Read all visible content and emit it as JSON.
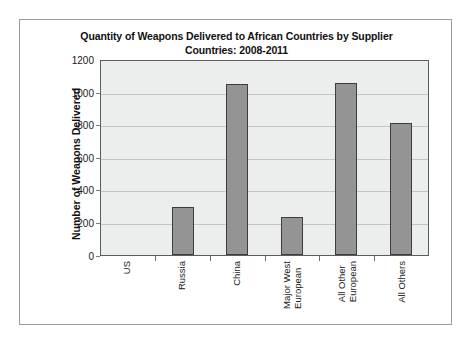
{
  "chart_data": {
    "type": "bar",
    "title": "Quantity of Weapons Delivered to African Countries by Supplier Countries: 2008-2011",
    "title_lines": [
      "Quantity of Weapons Delivered to African Countries by Supplier",
      "Countries: 2008-2011"
    ],
    "xlabel": "",
    "ylabel": "Number of Weapons Delivered",
    "ylim": [
      0,
      1200
    ],
    "ytick_step": 200,
    "yticks": [
      1200,
      1000,
      800,
      600,
      400,
      200,
      0
    ],
    "ytick_labels": [
      "1200",
      "1000",
      "800",
      "600",
      "400",
      "200",
      "0"
    ],
    "grid": true,
    "legend": false,
    "categories": [
      "US",
      "Russia",
      "China",
      "Major West European",
      "All Other European",
      "All Others"
    ],
    "category_label_lines": [
      [
        "US"
      ],
      [
        "Russia"
      ],
      [
        "China"
      ],
      [
        "Major West",
        "European"
      ],
      [
        "All Other",
        "European"
      ],
      [
        "All Others"
      ]
    ],
    "values": [
      0,
      300,
      1060,
      235,
      1062,
      815
    ],
    "series": [
      {
        "name": "Number of Weapons Delivered",
        "values": [
          0,
          300,
          1060,
          235,
          1062,
          815
        ]
      }
    ],
    "colors": {
      "bar_fill": "#949494",
      "bar_border": "#3d3d3d",
      "plot_background": "#eceded",
      "gridline": "#c2c4c6",
      "axis": "#5c5c5c",
      "frame": "#9b9b9b",
      "page_background": "#ffffff",
      "text": "#1a1a1a"
    }
  }
}
